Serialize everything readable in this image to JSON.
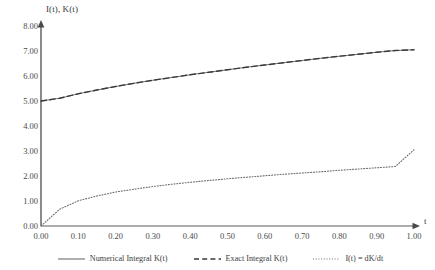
{
  "chart_data": {
    "type": "line",
    "title": "",
    "xlabel": "t",
    "ylabel": "I(t), K(t)",
    "xlim": [
      0.0,
      1.0
    ],
    "ylim": [
      0.0,
      8.0
    ],
    "grid": false,
    "legend_position": "bottom",
    "xticks": [
      "0.00",
      "0.10",
      "0.20",
      "0.30",
      "0.40",
      "0.50",
      "0.60",
      "0.70",
      "0.80",
      "0.90",
      "1.00"
    ],
    "xtick_values": [
      0.0,
      0.1,
      0.2,
      0.3,
      0.4,
      0.5,
      0.6,
      0.7,
      0.8,
      0.9,
      1.0
    ],
    "yticks": [
      "0.00",
      "1.00",
      "2.00",
      "3.00",
      "4.00",
      "5.00",
      "6.00",
      "7.00",
      "8.00"
    ],
    "ytick_values": [
      0,
      1,
      2,
      3,
      4,
      5,
      6,
      7,
      8
    ],
    "x": [
      0.0,
      0.05,
      0.1,
      0.15,
      0.2,
      0.25,
      0.3,
      0.35,
      0.4,
      0.45,
      0.5,
      0.55,
      0.6,
      0.65,
      0.7,
      0.75,
      0.8,
      0.85,
      0.9,
      0.95,
      1.0
    ],
    "series": [
      {
        "name": "Numerical Integral K(t)",
        "style": "solid",
        "color": "#7a7a7a",
        "values": [
          5.0,
          5.11,
          5.29,
          5.44,
          5.58,
          5.71,
          5.83,
          5.94,
          6.05,
          6.15,
          6.25,
          6.35,
          6.44,
          6.53,
          6.62,
          6.71,
          6.79,
          6.87,
          6.95,
          7.02,
          7.05
        ]
      },
      {
        "name": "Exact Integral K(t)",
        "style": "dashed",
        "color": "#3a3a3a",
        "values": [
          5.0,
          5.11,
          5.29,
          5.44,
          5.58,
          5.71,
          5.83,
          5.94,
          6.05,
          6.15,
          6.25,
          6.35,
          6.44,
          6.53,
          6.62,
          6.71,
          6.79,
          6.87,
          6.95,
          7.02,
          7.05
        ]
      },
      {
        "name": "I(t) = dK/dt",
        "style": "dotted",
        "color": "#6d6d6d",
        "values": [
          0.0,
          0.67,
          1.01,
          1.2,
          1.36,
          1.47,
          1.58,
          1.67,
          1.75,
          1.82,
          1.89,
          1.95,
          2.01,
          2.07,
          2.12,
          2.17,
          2.23,
          2.28,
          2.33,
          2.38,
          3.05
        ]
      }
    ]
  },
  "axes": {
    "y_label": "I(t), K(t)",
    "x_label": "t"
  },
  "legend": {
    "items": [
      {
        "label": "Numerical Integral K(t)",
        "style": "solid"
      },
      {
        "label": "Exact Integral K(t)",
        "style": "dashed"
      },
      {
        "label": "I(t) = dK/dt",
        "style": "dotted"
      }
    ]
  },
  "colors": {
    "axis": "#5a5a5a",
    "text": "#3d3d3d",
    "numerical": "#7a7a7a",
    "exact": "#3a3a3a",
    "derivative": "#6d6d6d",
    "background": "#ffffff"
  }
}
